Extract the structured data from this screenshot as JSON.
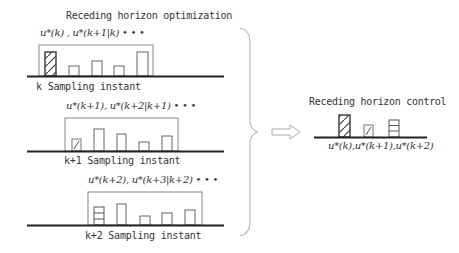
{
  "left": {
    "title": "Receding horizon optimization",
    "rows": [
      {
        "sequence": "u*(k) , u*(k+1|k)  •  •  •",
        "label": "k Sampling instant"
      },
      {
        "sequence": "u*(k+1), u*(k+2|k+1)  •  •  •",
        "label": "k+1 Sampling instant"
      },
      {
        "sequence": "u*(k+2), u*(k+3|k+2)  •  •  •",
        "label": "k+2 Sampling instant"
      }
    ]
  },
  "right": {
    "title": "Receding horizon control",
    "sequence": "u*(k),u*(k+1),u*(k+2)"
  },
  "icons": {
    "brace": "right-curly-brace",
    "arrow": "hollow-right-arrow"
  },
  "colors": {
    "line": "#333333",
    "bar_stroke": "#555555",
    "brace": "#bbbbbb",
    "arrow": "#aaaaaa"
  }
}
